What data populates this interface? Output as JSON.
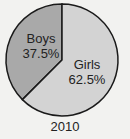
{
  "chart_data": {
    "type": "pie",
    "title": "2010",
    "categories": [
      "Boys",
      "Girls"
    ],
    "values": [
      37.5,
      62.5
    ],
    "labels": [
      "37.5%",
      "62.5%"
    ],
    "colors": [
      "#a9a9a9",
      "#d3d3d3"
    ],
    "start_angle_deg": 0,
    "direction": "counterclockwise-for-first"
  },
  "labels": {
    "boys_name": "Boys",
    "boys_pct": "37.5%",
    "girls_name": "Girls",
    "girls_pct": "62.5%",
    "year": "2010"
  }
}
